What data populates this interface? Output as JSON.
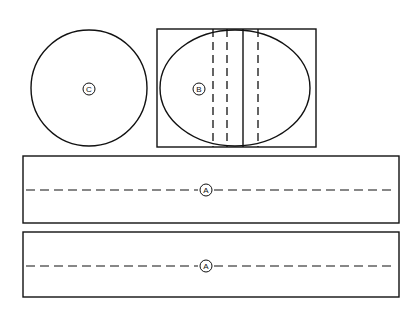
{
  "drawing": {
    "title": "Sectional views with cutting plane callouts",
    "background_color": "#ffffff",
    "line_color": "#111111",
    "width": 420,
    "height": 316,
    "views": [
      {
        "id": "view-c",
        "label": "C",
        "shape": "circle",
        "cx": 89,
        "cy": 88,
        "r": 58,
        "label_x": 89,
        "label_y": 89,
        "label_r": 6
      },
      {
        "id": "view-b",
        "label": "B",
        "shape": "circle-in-rectangle",
        "rect_x": 157,
        "rect_y": 29,
        "rect_w": 159,
        "rect_h": 118,
        "ellipse_cx": 235,
        "ellipse_cy": 88,
        "ellipse_rx": 75,
        "ellipse_ry": 58,
        "label_x": 199,
        "label_y": 89,
        "label_r": 6,
        "vertical_lines": [
          {
            "x": 213,
            "style": "dashed"
          },
          {
            "x": 227,
            "style": "dashed"
          },
          {
            "x": 243,
            "style": "solid"
          },
          {
            "x": 258,
            "style": "dashed"
          }
        ]
      },
      {
        "id": "view-a-upper",
        "label": "A",
        "shape": "rectangle-with-centerline",
        "rect_x": 23,
        "rect_y": 156,
        "rect_w": 376,
        "rect_h": 67,
        "centerline_y": 190,
        "label_x": 206,
        "label_y": 190,
        "label_r": 6
      },
      {
        "id": "view-a-lower",
        "label": "A",
        "shape": "rectangle-with-centerline",
        "rect_x": 23,
        "rect_y": 232,
        "rect_w": 376,
        "rect_h": 65,
        "centerline_y": 266,
        "label_x": 206,
        "label_y": 266,
        "label_r": 6
      }
    ]
  }
}
